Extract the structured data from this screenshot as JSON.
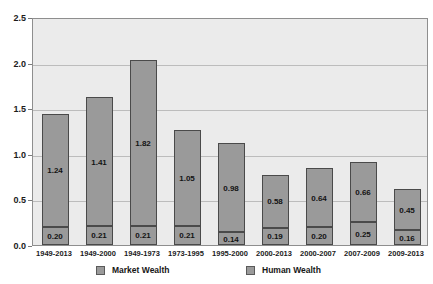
{
  "chart_data": {
    "type": "bar",
    "stacked": true,
    "title": "",
    "subtitle": "",
    "xlabel": "",
    "ylabel": "",
    "ylim": [
      0.0,
      2.5
    ],
    "yticks": [
      "0.0",
      "0.5",
      "1.0",
      "1.5",
      "2.0",
      "2.5"
    ],
    "ytick_values": [
      0.0,
      0.5,
      1.0,
      1.5,
      2.0,
      2.5
    ],
    "grid": true,
    "legend_position": "bottom",
    "categories": [
      "1949-2013",
      "1949-2000",
      "1949-1973",
      "1973-1995",
      "1995-2000",
      "2000-2013",
      "2000-2007",
      "2007-2009",
      "2009-2013"
    ],
    "series": [
      {
        "name": "Market Wealth",
        "color": "#9a9a9a",
        "values": [
          0.2,
          0.21,
          0.21,
          0.21,
          0.14,
          0.19,
          0.2,
          0.25,
          0.16
        ],
        "labels": [
          "0.20",
          "0.21",
          "0.21",
          "0.21",
          "0.14",
          "0.19",
          "0.20",
          "0.25",
          "0.16"
        ]
      },
      {
        "name": "Human Wealth",
        "color": "#9a9a9a",
        "values": [
          1.24,
          1.41,
          1.82,
          1.05,
          0.98,
          0.58,
          0.64,
          0.66,
          0.45
        ],
        "labels": [
          "1.24",
          "1.41",
          "1.82",
          "1.05",
          "0.98",
          "0.58",
          "0.64",
          "0.66",
          "0.45"
        ]
      }
    ],
    "totals": [
      1.44,
      1.62,
      2.03,
      1.26,
      1.12,
      0.77,
      0.84,
      0.91,
      0.61
    ]
  },
  "legend": {
    "entries": [
      {
        "label": "Market Wealth"
      },
      {
        "label": "Human Wealth"
      }
    ]
  },
  "colors": {
    "bar_fill": "#9a9a9a",
    "bar_border": "#4a4a4a",
    "plot_background": "#ebebeb",
    "plot_border": "#8e8e8e",
    "gridline": "#bcbcbc",
    "text": "#1b1b1b"
  }
}
